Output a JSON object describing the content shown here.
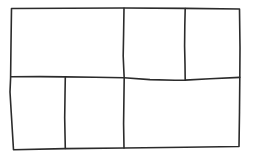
{
  "figure": {
    "kind": "line-drawing",
    "background_color": "#ffffff",
    "stroke_color": "#2b2b2b",
    "stroke_width": 1.6,
    "canvas": {
      "width": 255,
      "height": 158
    },
    "outer_border": {
      "name": "outer-rectangle",
      "path": "M 11.5 8.5 L 124 8.0 L 185 8.4 L 239.5 9.0 L 240 48 L 239.8 78 L 239.5 112 L 239 146.5 L 185 147.3 L 124 148.0 L 65 148.6 L 13.5 149.8 L 11.2 112 L 10.0 92 L 10.6 78 L 11.0 44 Z"
    },
    "interior_lines": [
      {
        "name": "vertical-divider-center",
        "orientation": "vertical",
        "x": 124,
        "from_y": 8,
        "to_y": 148,
        "spans": "full-height",
        "path": "M 124.0 8.2 L 123.6 34 L 123.2 56 L 123.8 70 L 124.2 78 L 123.9 100 L 123.6 124 L 124.0 148.0"
      },
      {
        "name": "horizontal-divider-middle",
        "orientation": "horizontal",
        "y": 78,
        "from_x": 11,
        "to_x": 240,
        "spans": "full-width",
        "path": "M 10.7 76.8 L 40 76.6 L 65 76.9 L 95 77.2 L 124 77.8 L 150 79.6 L 175 80.3 L 185 80.1 L 210 78.8 L 239.8 77.4"
      },
      {
        "name": "vertical-divider-top-right",
        "orientation": "vertical",
        "x": 185,
        "from_y": 8,
        "to_y": 79,
        "spans": "top-band-only",
        "path": "M 185.2 8.6 L 184.8 26 L 184.6 46 L 185.0 64 L 185.2 79.8"
      },
      {
        "name": "vertical-divider-bottom-left",
        "orientation": "vertical",
        "x": 65,
        "from_y": 77,
        "to_y": 148,
        "spans": "bottom-band-only",
        "path": "M 65.3 77.0 L 65.0 96 L 64.7 118 L 65.0 134 L 65.3 148.4"
      }
    ],
    "regions": [
      {
        "name": "cell-top-left",
        "label": "",
        "x": 11,
        "y": 8,
        "width": 113,
        "height": 69
      },
      {
        "name": "cell-top-middle",
        "label": "",
        "x": 124,
        "y": 8,
        "width": 61,
        "height": 71
      },
      {
        "name": "cell-top-right",
        "label": "",
        "x": 185,
        "y": 8,
        "width": 55,
        "height": 70
      },
      {
        "name": "cell-bottom-left",
        "label": "",
        "x": 11,
        "y": 77,
        "width": 54,
        "height": 72
      },
      {
        "name": "cell-bottom-middle",
        "label": "",
        "x": 65,
        "y": 77,
        "width": 59,
        "height": 72
      },
      {
        "name": "cell-bottom-right",
        "label": "",
        "x": 124,
        "y": 79,
        "width": 116,
        "height": 69
      }
    ],
    "region_count": 6,
    "interior_line_count": 4
  }
}
